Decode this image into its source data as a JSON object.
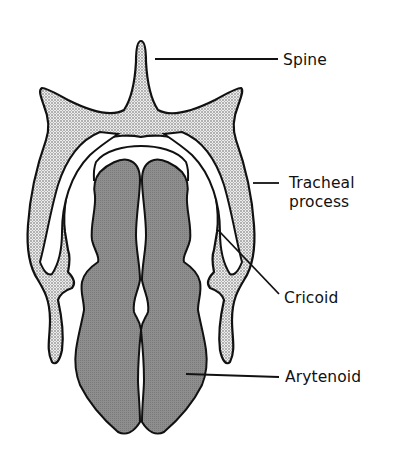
{
  "diagram": {
    "colors": {
      "outline": "#111111",
      "stipple_fill": "#e9e9e9",
      "stipple_dot": "#555555",
      "arytenoid_fill": "#8c8c8c",
      "background": "#ffffff"
    },
    "labels": [
      {
        "id": "spine",
        "lines": [
          "Spine"
        ]
      },
      {
        "id": "tracheal-process",
        "lines": [
          "Tracheal",
          "process"
        ]
      },
      {
        "id": "cricoid",
        "lines": [
          "Cricoid"
        ]
      },
      {
        "id": "arytenoid",
        "lines": [
          "Arytenoid"
        ]
      }
    ]
  }
}
